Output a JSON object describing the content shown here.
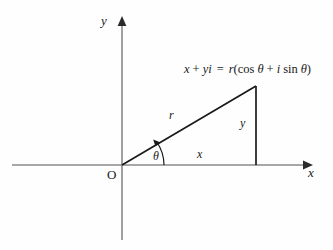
{
  "figure": {
    "background_color": "#fefefe",
    "axis_color": "#808080",
    "line_color": "#1a1a1a"
  },
  "axes": {
    "y_axis_label": "y",
    "x_axis_label": "x",
    "origin_label": "O"
  },
  "triangle": {
    "hypotenuse_label": "r",
    "horizontal_leg_label": "x",
    "vertical_leg_label": "y",
    "angle_label": "θ"
  },
  "equation": {
    "lhs_x": "x",
    "plus": "+",
    "lhs_yi": "yi",
    "equals": "=",
    "r": "r",
    "open_paren": "(",
    "cos": "cos",
    "theta1": "θ",
    "plus2": "+",
    "i": "i",
    "sin": "sin",
    "theta2": "θ",
    "close_paren": ")",
    "full_text": "x + yi = r(cos θ + i sin θ)"
  },
  "geometry": {
    "origin_point": "(122, 165)",
    "apex_point": "(256, 86)",
    "foot_point": "(256, 165)",
    "x_axis_span": "12 to 306",
    "y_axis_span": "18 to 240"
  }
}
